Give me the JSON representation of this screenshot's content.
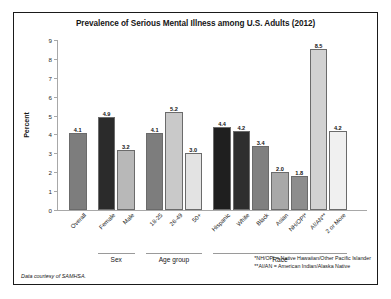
{
  "chart_data": {
    "type": "bar",
    "title": "Prevalence of Serious Mental Illness among U.S. Adults (2012)",
    "xlabel": "",
    "ylabel": "Percent",
    "ylim": [
      0,
      9
    ],
    "yticks": [
      "0",
      "1",
      "2",
      "3",
      "4",
      "5",
      "6",
      "7",
      "8",
      "9"
    ],
    "grid": false,
    "legend": "none",
    "categories": [
      "Overall",
      "Female",
      "Male",
      "18-25",
      "26-49",
      "50+",
      "Hispanic",
      "White",
      "Black",
      "Asian",
      "NH/OPI*",
      "AI/AN**",
      "2 or More"
    ],
    "values": [
      4.1,
      4.9,
      3.2,
      4.1,
      5.2,
      3.0,
      4.4,
      4.2,
      3.4,
      2.0,
      1.8,
      8.5,
      4.2
    ],
    "bar_colors": [
      "#7d7d7d",
      "#2b2b2b",
      "#b8b8b8",
      "#7d7d7d",
      "#c9c9c9",
      "#e3e3e3",
      "#1f1f1f",
      "#2e2e2e",
      "#808080",
      "#a8a8a8",
      "#8d8d8d",
      "#d2d2d2",
      "#f0f0f0"
    ],
    "groups": [
      {
        "label": "Sex",
        "members": [
          "Female",
          "Male"
        ]
      },
      {
        "label": "Age group",
        "members": [
          "18-25",
          "26-49",
          "50+"
        ]
      },
      {
        "label": "Race",
        "members": [
          "Hispanic",
          "White",
          "Black",
          "Asian",
          "NH/OPI*",
          "AI/AN**",
          "2 or More"
        ]
      }
    ],
    "annotations": [
      "*NH/OPI = Native Hawaiian/Other Pacific Islander",
      "**AI/AN = American Indian/Alaska Native"
    ],
    "source": "Data courtesy of SAMHSA."
  },
  "footnotes": {
    "line1": "*NH/OPI = Native Hawaiian/Other Pacific Islander",
    "line2": "**AI/AN = American Indian/Alaska Native"
  },
  "source_note": "Data courtesy of SAMHSA.",
  "group_labels": {
    "sex": "Sex",
    "age": "Age group",
    "race": "Race"
  }
}
